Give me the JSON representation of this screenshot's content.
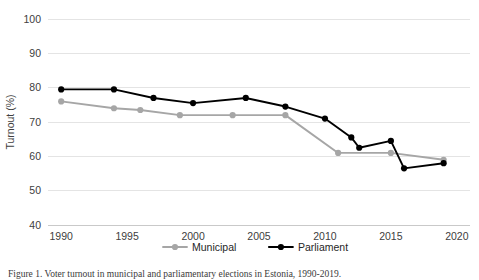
{
  "chart_data": {
    "type": "line",
    "title": "",
    "xlabel": "",
    "ylabel": "Turnout (%)",
    "xlim": [
      1989,
      2021
    ],
    "ylim": [
      40,
      100
    ],
    "ytick_values": [
      40,
      50,
      60,
      70,
      80,
      90,
      100
    ],
    "ytick_labels": [
      "40",
      "50",
      "60",
      "70",
      "80",
      "90",
      "100"
    ],
    "xtick_values": [
      1990,
      1995,
      2000,
      2005,
      2010,
      2015,
      2020
    ],
    "xtick_labels": [
      "1990",
      "1995",
      "2000",
      "2005",
      "2010",
      "2015",
      "2020"
    ],
    "grid": "horizontal",
    "legend_position": "bottom-center",
    "series": [
      {
        "name": "Municipal",
        "color": "#a6a6a6",
        "marker": "circle",
        "points": [
          {
            "x": 1990,
            "y": 76.0
          },
          {
            "x": 1994,
            "y": 74.0
          },
          {
            "x": 1996,
            "y": 73.5
          },
          {
            "x": 1999,
            "y": 72.0
          },
          {
            "x": 2003,
            "y": 72.0
          },
          {
            "x": 2007,
            "y": 72.0
          },
          {
            "x": 2011,
            "y": 61.0
          },
          {
            "x": 2015,
            "y": 61.0
          },
          {
            "x": 2019,
            "y": 59.0
          }
        ]
      },
      {
        "name": "Parliament",
        "color": "#000000",
        "marker": "circle",
        "points": [
          {
            "x": 1990,
            "y": 79.5
          },
          {
            "x": 1994,
            "y": 79.5
          },
          {
            "x": 1997,
            "y": 77.0
          },
          {
            "x": 2000,
            "y": 75.5
          },
          {
            "x": 2004,
            "y": 77.0
          },
          {
            "x": 2007,
            "y": 74.5
          },
          {
            "x": 2010,
            "y": 71.0
          },
          {
            "x": 2012,
            "y": 65.5
          },
          {
            "x": 2012.6,
            "y": 62.5
          },
          {
            "x": 2015,
            "y": 64.5
          },
          {
            "x": 2016,
            "y": 56.5
          },
          {
            "x": 2019,
            "y": 58.0
          }
        ]
      }
    ],
    "legend": [
      {
        "label": "Municipal",
        "color": "#a6a6a6"
      },
      {
        "label": "Parliament",
        "color": "#000000"
      }
    ]
  },
  "caption": {
    "text": "Figure 1. Voter turnout in municipal and parliamentary elections in Estonia, 1990-2019."
  },
  "colors": {
    "municipal": "#a6a6a6",
    "parliament": "#000000",
    "grid": "#e4e4e4",
    "text": "#404040",
    "background": "#ffffff"
  }
}
